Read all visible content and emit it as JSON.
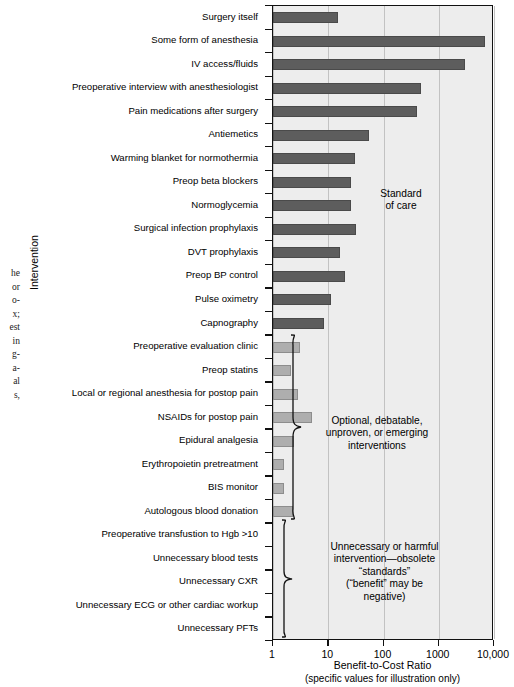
{
  "chart_data": {
    "type": "bar",
    "orientation": "horizontal",
    "title": "",
    "xlabel": "Benefit-to-Cost Ratio",
    "xlabel_sub": "(specific values for illustration only)",
    "ylabel": "Intervention",
    "xscale": "log",
    "xlim": [
      1,
      10000
    ],
    "xticks": [
      1,
      10,
      100,
      1000,
      10000
    ],
    "xticklabels": [
      "1",
      "10",
      "100",
      "1000",
      "10,000"
    ],
    "grid": "vertical",
    "legend": "none",
    "categories": [
      "Surgery itself",
      "Some form of anesthesia",
      "IV access/fluids",
      "Preoperative interview with anesthesiologist",
      "Pain medications after surgery",
      "Antiemetics",
      "Warming blanket for normothermia",
      "Preop beta blockers",
      "Normoglycemia",
      "Surgical infection prophylaxis",
      "DVT prophylaxis",
      "Preop BP control",
      "Pulse oximetry",
      "Capnography",
      "Preoperative evaluation clinic",
      "Preop statins",
      "Local or regional anesthesia for postop pain",
      "NSAIDs for postop pain",
      "Epidural analgesia",
      "Erythropoietin pretreatment",
      "BIS monitor",
      "Autologous blood donation",
      "Preoperative transfustion to Hgb >10",
      "Unnecessary blood tests",
      "Unnecessary CXR",
      "Unnecessary ECG or other cardiac workup",
      "Unnecessary PFTs"
    ],
    "values": [
      15,
      7000,
      3000,
      480,
      400,
      55,
      30,
      26,
      26,
      32,
      16,
      20,
      11,
      8.5,
      3.1,
      2.1,
      2.8,
      5.0,
      2.4,
      1.6,
      1.6,
      2.3,
      null,
      null,
      null,
      null,
      null
    ],
    "series_group": [
      "standard",
      "standard",
      "standard",
      "standard",
      "standard",
      "standard",
      "standard",
      "standard",
      "standard",
      "standard",
      "standard",
      "standard",
      "standard",
      "standard",
      "optional",
      "optional",
      "optional",
      "optional",
      "optional",
      "optional",
      "optional",
      "optional",
      "harmful",
      "harmful",
      "harmful",
      "harmful",
      "harmful"
    ],
    "colors": {
      "standard_bar": "#5d5d5d",
      "optional_bar": "#aeaeae",
      "plot_background": "#ededed",
      "gridline": "#c2c2c2",
      "axis": "#111111"
    },
    "annotations": [
      {
        "id": "standard-of-care",
        "lines": [
          "Standard",
          "of care"
        ]
      },
      {
        "id": "optional-group",
        "lines": [
          "Optional, debatable,",
          "unproven, or emerging",
          "interventions"
        ]
      },
      {
        "id": "harmful-group",
        "lines": [
          "Unnecessary or harmful",
          "intervention—obsolete",
          "“standards”",
          "(“benefit” may be",
          "negative)"
        ]
      }
    ]
  },
  "margin_caption_fragments": [
    "he",
    "or",
    "o-",
    "x;",
    "est",
    "in",
    "g-",
    "a-",
    "al",
    "s,"
  ]
}
